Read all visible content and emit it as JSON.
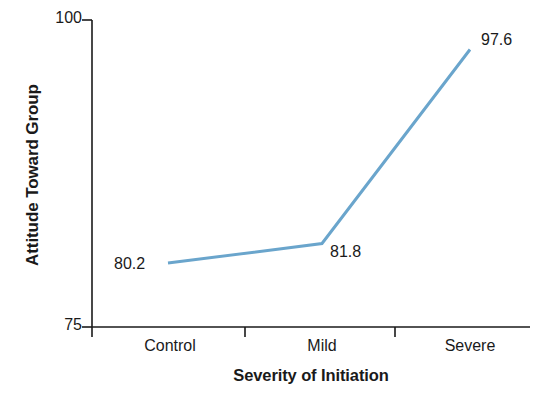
{
  "chart_data": {
    "type": "line",
    "title": "",
    "xlabel": "Severity of Initiation",
    "ylabel": "Attitude Toward Group",
    "categories": [
      "Control",
      "Mild",
      "Severe"
    ],
    "values": [
      80.2,
      81.8,
      97.6
    ],
    "point_labels": [
      "80.2",
      "81.8",
      "97.6"
    ],
    "ylim": [
      75,
      100
    ],
    "ytick_labels": [
      "100",
      "75"
    ],
    "ytick_values": [
      100,
      75
    ],
    "grid": false,
    "legend": false,
    "series_color": "#6aa5cc",
    "axis_color": "#1a1a1a"
  },
  "axes": {
    "y_title": "Attitude Toward Group",
    "x_title": "Severity of Initiation",
    "y_max_label": "100",
    "y_min_label": "75",
    "x_categories": {
      "control": "Control",
      "mild": "Mild",
      "severe": "Severe"
    }
  },
  "data_labels": {
    "control": "80.2",
    "mild": "81.8",
    "severe": "97.6"
  }
}
